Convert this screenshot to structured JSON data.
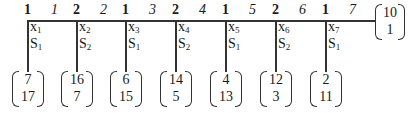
{
  "diagram": {
    "top_labels": [
      {
        "num": "1",
        "ital": "1"
      },
      {
        "num": "2",
        "ital": "2"
      },
      {
        "num": "1",
        "ital": "3"
      },
      {
        "num": "2",
        "ital": "4"
      },
      {
        "num": "1",
        "ital": "5"
      },
      {
        "num": "2",
        "ital": "6"
      },
      {
        "num": "1",
        "ital": "7"
      }
    ],
    "branches": [
      {
        "x": "x",
        "xsub": "1",
        "s": "S",
        "ssub": "1",
        "vec": [
          "7",
          "17"
        ]
      },
      {
        "x": "x",
        "xsub": "2",
        "s": "S",
        "ssub": "2",
        "vec": [
          "16",
          "7"
        ]
      },
      {
        "x": "x",
        "xsub": "3",
        "s": "S",
        "ssub": "1",
        "vec": [
          "6",
          "15"
        ]
      },
      {
        "x": "x",
        "xsub": "4",
        "s": "S",
        "ssub": "2",
        "vec": [
          "14",
          "5"
        ]
      },
      {
        "x": "x",
        "xsub": "5",
        "s": "S",
        "ssub": "1",
        "vec": [
          "4",
          "13"
        ]
      },
      {
        "x": "x",
        "xsub": "6",
        "s": "S",
        "ssub": "2",
        "vec": [
          "12",
          "3"
        ]
      },
      {
        "x": "x",
        "xsub": "7",
        "s": "S",
        "ssub": "1",
        "vec": [
          "2",
          "11"
        ]
      }
    ],
    "end_vector": [
      "10",
      "1"
    ]
  }
}
